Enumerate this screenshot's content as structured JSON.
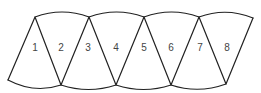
{
  "diagram": {
    "stroke_color": "#222222",
    "label_color": "#444444",
    "background": "#ffffff",
    "top_vertices": [
      [
        35,
        17
      ],
      [
        89,
        17
      ],
      [
        144,
        17
      ],
      [
        199,
        17
      ],
      [
        253,
        18
      ]
    ],
    "bottom_vertices": [
      [
        8,
        80
      ],
      [
        61,
        85
      ],
      [
        116,
        85
      ],
      [
        171,
        85
      ],
      [
        226,
        84
      ]
    ],
    "segments": [
      {
        "label": "1",
        "x": 35,
        "y": 48
      },
      {
        "label": "2",
        "x": 61,
        "y": 48
      },
      {
        "label": "3",
        "x": 88,
        "y": 48
      },
      {
        "label": "4",
        "x": 116,
        "y": 48
      },
      {
        "label": "5",
        "x": 144,
        "y": 48
      },
      {
        "label": "6",
        "x": 171,
        "y": 48
      },
      {
        "label": "7",
        "x": 200,
        "y": 48
      },
      {
        "label": "8",
        "x": 227,
        "y": 48
      }
    ]
  }
}
